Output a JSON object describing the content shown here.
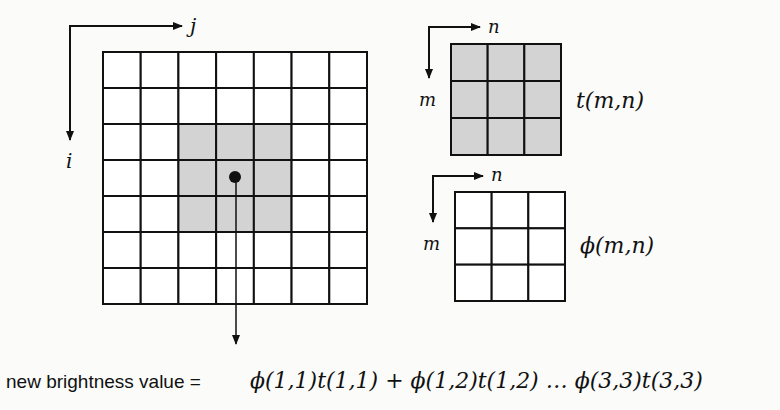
{
  "main_grid": {
    "rows": 7,
    "cols": 7,
    "axis_horizontal_label": "j",
    "axis_vertical_label": "i",
    "highlight": {
      "row_start": 2,
      "col_start": 2,
      "size": 3
    },
    "center_marker": {
      "row": 3,
      "col": 3
    }
  },
  "template": {
    "rows": 3,
    "cols": 3,
    "axis_horizontal_label": "n",
    "axis_vertical_label": "m",
    "name_label": "t(m,n)",
    "filled": true
  },
  "kernel": {
    "rows": 3,
    "cols": 3,
    "axis_horizontal_label": "n",
    "axis_vertical_label": "m",
    "name_label": "ϕ(m,n)",
    "filled": false
  },
  "formula": {
    "prefix": "new brightness value =",
    "expression": "ϕ(1,1)t(1,1) + ϕ(1,2)t(1,2) … ϕ(3,3)t(3,3)"
  },
  "colors": {
    "line": "#111111",
    "highlight_fill": "#d3d3d3",
    "background": "#fbfbfa"
  }
}
